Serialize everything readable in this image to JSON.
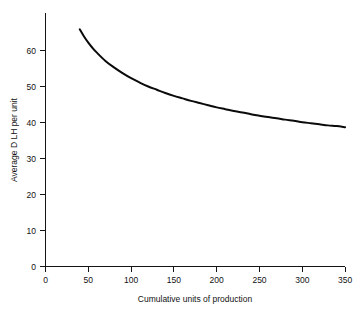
{
  "chart_data": {
    "type": "line",
    "title": "",
    "subtitle": "",
    "xlabel": "Cumulative units of production",
    "ylabel": "Average D LH per unit",
    "xlim": [
      0,
      380
    ],
    "ylim": [
      0,
      66
    ],
    "xticks": [
      0,
      50,
      100,
      150,
      200,
      250,
      300,
      350
    ],
    "xtick_labels": [
      "0",
      "50",
      "100",
      "150",
      "200",
      "250",
      "300",
      "350"
    ],
    "yticks": [
      0,
      10,
      20,
      30,
      40,
      50,
      60
    ],
    "ytick_labels": [
      "0",
      "10",
      "20",
      "30",
      "40",
      "50",
      "60"
    ],
    "grid": false,
    "legend": null,
    "annotations": [],
    "series": [
      {
        "name": "Average DLH per unit",
        "color": "#0a0a0a",
        "x": [
          40,
          45,
          50,
          55,
          60,
          70,
          80,
          90,
          100,
          110,
          120,
          130,
          140,
          150,
          160,
          170,
          180,
          190,
          200,
          210,
          220,
          230,
          240,
          250,
          260,
          270,
          280,
          290,
          300,
          310,
          320,
          330,
          340,
          350
        ],
        "y": [
          65.9,
          63.9,
          62.2,
          60.7,
          59.4,
          57.1,
          55.3,
          53.7,
          52.3,
          51.1,
          50.0,
          49.1,
          48.2,
          47.4,
          46.7,
          46.0,
          45.4,
          44.8,
          44.2,
          43.7,
          43.2,
          42.8,
          42.3,
          41.9,
          41.5,
          41.2,
          40.8,
          40.5,
          40.1,
          39.8,
          39.5,
          39.2,
          39.0,
          38.7
        ]
      }
    ]
  },
  "axes": {
    "y_title": "Average D LH per unit",
    "x_title": "Cumulative units of production",
    "y_tick_0": "0",
    "y_tick_10": "10",
    "y_tick_20": "20",
    "y_tick_30": "30",
    "y_tick_40": "40",
    "y_tick_50": "50",
    "y_tick_60": "60",
    "x_tick_0": "0",
    "x_tick_50": "50",
    "x_tick_100": "100",
    "x_tick_150": "150",
    "x_tick_200": "200",
    "x_tick_250": "250",
    "x_tick_300": "300",
    "x_tick_350": "350"
  },
  "colors": {
    "curve": "#0a0a0a",
    "axis": "#141414",
    "background": "#ffffff",
    "text": "#121212"
  }
}
